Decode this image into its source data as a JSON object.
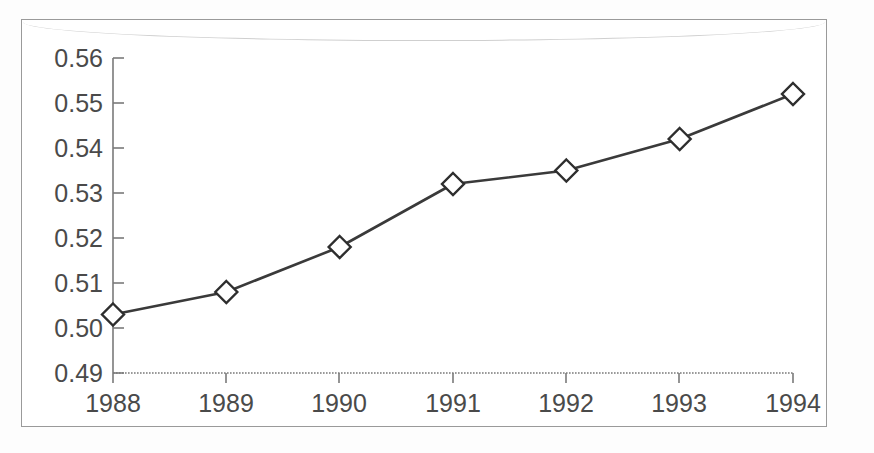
{
  "chart_data": {
    "type": "line",
    "title": "",
    "subtitle": "",
    "xlabel": "",
    "ylabel": "",
    "categories": [
      "1988",
      "1989",
      "1990",
      "1991",
      "1992",
      "1993",
      "1994"
    ],
    "x": [
      1988,
      1989,
      1990,
      1991,
      1992,
      1993,
      1994
    ],
    "values": [
      0.503,
      0.508,
      0.518,
      0.532,
      0.535,
      0.542,
      0.552
    ],
    "series": [
      {
        "name": "series-1",
        "values": [
          0.503,
          0.508,
          0.518,
          0.532,
          0.535,
          0.542,
          0.552
        ],
        "marker": "diamond",
        "marker_fill": "#ffffff",
        "line_color": "#3a3a3a"
      }
    ],
    "ylim": [
      0.49,
      0.56
    ],
    "yticks": [
      0.49,
      0.5,
      0.51,
      0.52,
      0.53,
      0.54,
      0.55,
      0.56
    ],
    "ytick_labels": [
      "0.49",
      "0.50",
      "0.51",
      "0.52",
      "0.53",
      "0.54",
      "0.55",
      "0.56"
    ],
    "xticks": [
      1988,
      1989,
      1990,
      1991,
      1992,
      1993,
      1994
    ],
    "xtick_labels": [
      "1988",
      "1989",
      "1990",
      "1991",
      "1992",
      "1993",
      "1994"
    ],
    "grid": false,
    "legend": false,
    "legend_position": "none",
    "annotations": []
  },
  "axes": {
    "y_labels": [
      "0.56",
      "0.55",
      "0.54",
      "0.53",
      "0.52",
      "0.51",
      "0.50",
      "0.49"
    ],
    "x_labels": [
      "1988",
      "1989",
      "1990",
      "1991",
      "1992",
      "1993",
      "1994"
    ]
  },
  "colors": {
    "frame": "#9a9a9a",
    "axis": "#6b6b6b",
    "line": "#3a3a3a",
    "marker_fill": "#ffffff",
    "marker_stroke": "#2e2e2e",
    "text": "#4a4a4a",
    "background": "#ffffff"
  }
}
